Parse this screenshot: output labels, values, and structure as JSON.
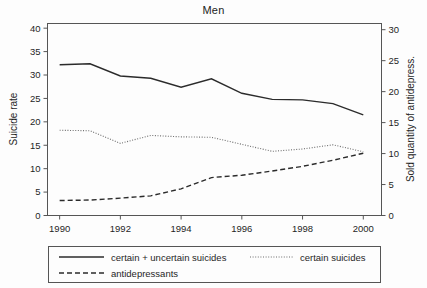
{
  "chart_data": {
    "type": "line",
    "title": "Men",
    "xlabel": "",
    "ylabel": "Suicide rate",
    "y2label": "Sold quantity of antidepress.",
    "x": [
      1990,
      1991,
      1992,
      1993,
      1994,
      1995,
      1996,
      1997,
      1998,
      1999,
      2000
    ],
    "xticks": [
      1990,
      1992,
      1994,
      1996,
      1998,
      2000
    ],
    "xlim": [
      1989.6,
      2000.6
    ],
    "yticks": [
      0,
      5,
      10,
      15,
      20,
      25,
      30,
      35,
      40
    ],
    "ylim": [
      0,
      41
    ],
    "y2ticks": [
      0,
      5,
      10,
      15,
      20,
      25,
      30
    ],
    "y2lim": [
      0,
      31
    ],
    "grid": false,
    "legend_position": "below-axes",
    "series": [
      {
        "name": "certain + uncertain suicides",
        "style": "solid",
        "axis": "left",
        "values": [
          32.2,
          32.4,
          29.8,
          29.3,
          27.4,
          29.2,
          26.1,
          24.8,
          24.7,
          23.9,
          21.5
        ]
      },
      {
        "name": "certain suicides",
        "style": "dotted",
        "axis": "left",
        "values": [
          18.2,
          18.1,
          15.4,
          17.1,
          16.8,
          16.7,
          15.2,
          13.7,
          14.2,
          15.1,
          13.6
        ]
      },
      {
        "name": "antidepressants",
        "style": "dashed",
        "axis": "left",
        "values": [
          3.2,
          3.3,
          3.7,
          4.2,
          5.7,
          8.1,
          8.6,
          9.5,
          10.5,
          11.8,
          13.3
        ]
      }
    ]
  },
  "legend": {
    "items": [
      {
        "label": "certain + uncertain suicides",
        "style": "solid"
      },
      {
        "label": "certain suicides",
        "style": "dotted"
      },
      {
        "label": "antidepressants",
        "style": "dashed"
      }
    ]
  },
  "axes": {
    "left_title": "Suicide rate",
    "right_title": "Sold quantity of antidepress.",
    "left_ticks": [
      "0",
      "5",
      "10",
      "15",
      "20",
      "25",
      "30",
      "35",
      "40"
    ],
    "right_ticks": [
      "0",
      "5",
      "10",
      "15",
      "20",
      "25",
      "30"
    ],
    "x_ticks": [
      "1990",
      "1992",
      "1994",
      "1996",
      "1998",
      "2000"
    ]
  },
  "colors": {
    "line_primary": "#2b2b2b",
    "line_secondary": "#6d6d6d",
    "frame": "#555555",
    "background": "#fdfdfd"
  }
}
